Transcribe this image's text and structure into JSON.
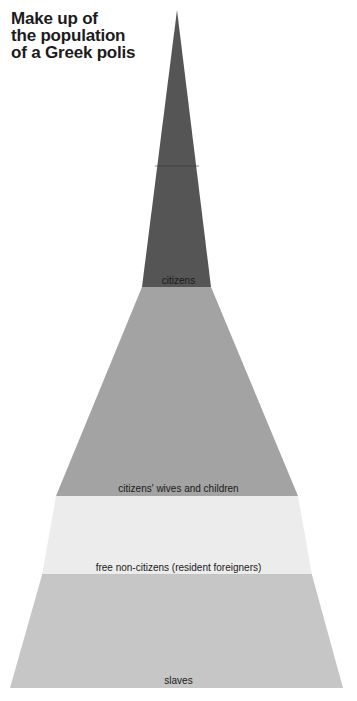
{
  "title": {
    "lines": [
      "Make up of",
      "the population",
      "of a Greek polis"
    ]
  },
  "diagram": {
    "type": "pyramid",
    "apex": [
      177,
      10
    ],
    "base_y": 688,
    "base_left_x": 10,
    "base_right_x": 343,
    "layers": [
      {
        "label": "citizens",
        "top_y": 10,
        "bottom_y": 287,
        "color": "#555555"
      },
      {
        "label": "citizens' wives and children",
        "top_y": 287,
        "bottom_y": 496,
        "color": "#a3a3a3"
      },
      {
        "label": "free non-citizens (resident foreigners)",
        "top_y": 496,
        "bottom_y": 575,
        "color": "#ececec"
      },
      {
        "label": "slaves",
        "top_y": 575,
        "bottom_y": 688,
        "color": "#c6c6c6"
      }
    ]
  }
}
